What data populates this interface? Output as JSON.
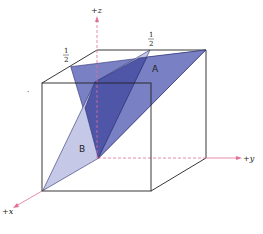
{
  "figure": {
    "type": "crystallographic-planes-in-unit-cube",
    "axes": {
      "z": "+z",
      "y": "+y",
      "x": "+x"
    },
    "planes": [
      {
        "label": "A",
        "color": "#7a80c4"
      },
      {
        "label": "B",
        "color": "#c6c8e8"
      }
    ],
    "overlap_color": "#4f56a8",
    "axis_color": "#e0709a",
    "intercepts": {
      "left": {
        "num": "1",
        "den": "2"
      },
      "right": {
        "num": "1",
        "den": "2"
      }
    },
    "stray_mark": "·"
  }
}
